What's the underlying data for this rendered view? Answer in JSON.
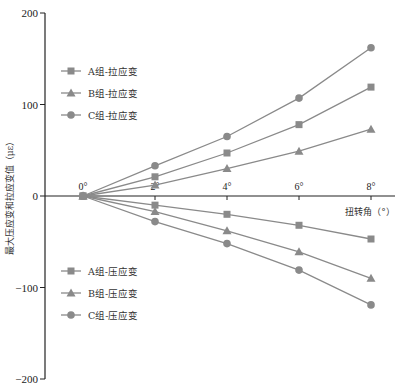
{
  "chart_data": {
    "type": "line",
    "title": "",
    "xlabel": "扭转角（°）",
    "ylabel": "最大压应变和拉应变值（με）",
    "x": [
      0,
      2,
      4,
      6,
      8
    ],
    "x_tick_labels": [
      "0°",
      "2°",
      "4°",
      "6°",
      "8°"
    ],
    "ylim": [
      -200,
      200
    ],
    "y_ticks": [
      200,
      100,
      0,
      -100,
      -200
    ],
    "y_tick_labels": [
      "200",
      "100",
      "0",
      "−100",
      "−200"
    ],
    "grid": false,
    "legend_position": "upper-left and lower-left (split)",
    "series": [
      {
        "name": "A组-拉应变",
        "marker": "square",
        "values": [
          0,
          21,
          47,
          78,
          119
        ]
      },
      {
        "name": "B组-拉应变",
        "marker": "triangle",
        "values": [
          0,
          12,
          30,
          49,
          73
        ]
      },
      {
        "name": "C组-拉应变",
        "marker": "circle",
        "values": [
          0,
          33,
          65,
          107,
          162
        ]
      },
      {
        "name": "A组-压应变",
        "marker": "square",
        "values": [
          0,
          -10,
          -20,
          -32,
          -47
        ]
      },
      {
        "name": "B组-压应变",
        "marker": "triangle",
        "values": [
          0,
          -17,
          -38,
          -61,
          -90
        ]
      },
      {
        "name": "C组-压应变",
        "marker": "circle",
        "values": [
          0,
          -28,
          -52,
          -81,
          -119
        ]
      }
    ],
    "colors": {
      "series": "#8a8a8a",
      "axis": "#222222"
    }
  }
}
